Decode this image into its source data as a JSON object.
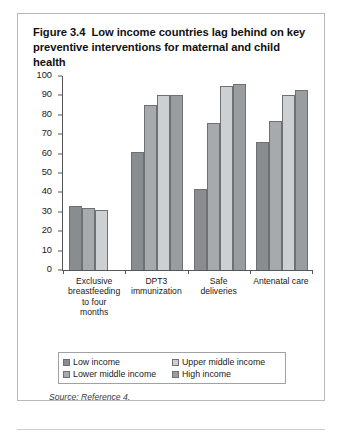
{
  "figure": {
    "number": "Figure 3.4",
    "title": "Low income countries lag behind on key preventive interventions for maternal and child health",
    "source": "Source: Reference 4."
  },
  "chart_data": {
    "type": "bar",
    "xlabel": "",
    "ylabel": "",
    "ylim": [
      0,
      100
    ],
    "yticks": [
      0,
      10,
      20,
      30,
      40,
      50,
      60,
      70,
      80,
      90,
      100
    ],
    "ytick_labels": [
      "0",
      "10",
      "20",
      "30",
      "40",
      "50",
      "60",
      "70",
      "80",
      "90",
      "100"
    ],
    "grid": false,
    "legend_position": "bottom",
    "categories": [
      "Exclusive breastfeeding to four months",
      "DPT3 immunization",
      "Safe deliveries",
      "Antenatal care"
    ],
    "category_lines": [
      [
        "Exclusive",
        "breastfeeding",
        "to four",
        "months"
      ],
      [
        "DPT3",
        "immunization"
      ],
      [
        "Safe",
        "deliveries"
      ],
      [
        "Antenatal care"
      ]
    ],
    "series": [
      {
        "name": "Low income",
        "color": "#8a8d90",
        "values": [
          33,
          61,
          42,
          66
        ]
      },
      {
        "name": "Lower middle income",
        "color": "#a7aaad",
        "values": [
          32,
          85,
          76,
          77
        ]
      },
      {
        "name": "Upper middle income",
        "color": "#cdd0d2",
        "values": [
          31,
          90,
          95,
          90
        ]
      },
      {
        "name": "High income",
        "color": "#9a9da0",
        "values": [
          null,
          90,
          96,
          93
        ]
      }
    ],
    "legend": [
      {
        "label": "Low income",
        "color": "#8a8d90"
      },
      {
        "label": "Upper middle income",
        "color": "#cdd0d2"
      },
      {
        "label": "Lower middle income",
        "color": "#a7aaad"
      },
      {
        "label": "High income",
        "color": "#9a9da0"
      }
    ],
    "annotations": []
  }
}
